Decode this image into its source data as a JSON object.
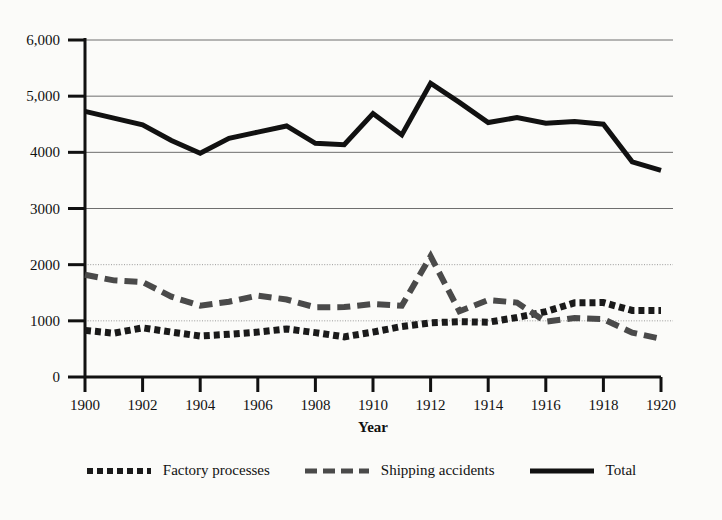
{
  "chart_data": {
    "type": "line",
    "title": "",
    "subtitle": "",
    "xlabel": "Year",
    "ylabel": "",
    "x": [
      1900,
      1901,
      1902,
      1903,
      1904,
      1905,
      1906,
      1907,
      1908,
      1909,
      1910,
      1911,
      1912,
      1913,
      1914,
      1915,
      1916,
      1917,
      1918,
      1919,
      1920
    ],
    "xticks": [
      "1900",
      "1902",
      "1904",
      "1906",
      "1908",
      "1910",
      "1912",
      "1914",
      "1916",
      "1918",
      "1920"
    ],
    "xtick_values": [
      1900,
      1902,
      1904,
      1906,
      1908,
      1910,
      1912,
      1914,
      1916,
      1918,
      1920
    ],
    "yticks": [
      "0",
      "1000",
      "2000",
      "3000",
      "4000",
      "5,000",
      "6,000"
    ],
    "ytick_values": [
      0,
      1000,
      2000,
      3000,
      4000,
      5000,
      6000
    ],
    "xlim": [
      1900,
      1920
    ],
    "ylim": [
      0,
      6000
    ],
    "grid": "horizontal",
    "legend_position": "bottom-center",
    "series": [
      {
        "name": "Factory processes",
        "style": "dotted",
        "color": "#1a1a1a",
        "values": [
          830,
          780,
          875,
          800,
          730,
          760,
          800,
          855,
          790,
          715,
          800,
          900,
          965,
          985,
          975,
          1060,
          1165,
          1320,
          1325,
          1185,
          1185
        ]
      },
      {
        "name": "Shipping accidents",
        "style": "dashed",
        "color": "#4a4a4a",
        "values": [
          1820,
          1720,
          1690,
          1430,
          1270,
          1340,
          1450,
          1380,
          1240,
          1245,
          1300,
          1270,
          2150,
          1170,
          1370,
          1325,
          985,
          1050,
          1030,
          790,
          680
        ]
      },
      {
        "name": "Total",
        "style": "solid",
        "color": "#111111",
        "values": [
          4730,
          4610,
          4490,
          4210,
          3985,
          4250,
          4360,
          4470,
          4160,
          4135,
          4690,
          4310,
          5230,
          4890,
          4530,
          4620,
          4520,
          4550,
          4500,
          3830,
          3680
        ]
      }
    ]
  },
  "legend": {
    "items": [
      {
        "label": "Factory processes",
        "swatch": "dotted-line-swatch"
      },
      {
        "label": "Shipping accidents",
        "swatch": "dashed-line-swatch"
      },
      {
        "label": "Total",
        "swatch": "solid-line-swatch"
      }
    ]
  },
  "axis": {
    "x_title": "Year"
  }
}
